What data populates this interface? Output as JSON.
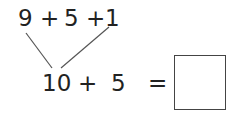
{
  "top_expression": {
    "terms": [
      "9",
      "+",
      "5",
      "+",
      "1"
    ]
  },
  "bottom_expression": {
    "terms": [
      "10",
      "+",
      "5",
      "="
    ]
  },
  "answer_box": {
    "value": ""
  },
  "colors": {
    "text": "#222222",
    "lines": "#555555",
    "box_border": "#444444"
  }
}
